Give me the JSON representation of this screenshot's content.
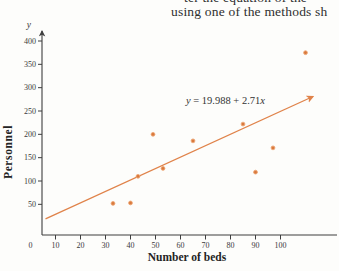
{
  "header": {
    "line1_clipped": "ter the equation of the",
    "line2": "using one of the methods sh"
  },
  "chart_data": {
    "type": "scatter",
    "title": "",
    "xlabel": "Number of beds",
    "ylabel": "Personnel",
    "y_axis_symbol": "y",
    "equation_label": "y = 19.988 + 2.71x",
    "x_ticks": [
      0,
      10,
      20,
      30,
      40,
      50,
      60,
      70,
      80,
      90,
      100
    ],
    "y_ticks": [
      50,
      100,
      150,
      200,
      250,
      300,
      350,
      400
    ],
    "xlim": [
      0,
      122
    ],
    "ylim": [
      0,
      428
    ],
    "grid": false,
    "legend": "none",
    "points": [
      [
        33,
        52
      ],
      [
        40,
        53
      ],
      [
        43,
        110
      ],
      [
        49,
        200
      ],
      [
        53,
        127
      ],
      [
        65,
        186
      ],
      [
        85,
        222
      ],
      [
        90,
        119
      ],
      [
        97,
        171
      ],
      [
        110,
        375
      ]
    ],
    "regression_line": {
      "x1": 6,
      "y1": 19,
      "x2": 113,
      "y2": 281
    },
    "colors": {
      "accent": "#E0834A",
      "point": "#D9793C",
      "point_halo": "#EDA878",
      "axis": "#3E3E3E",
      "text": "#2E2E2E"
    }
  }
}
